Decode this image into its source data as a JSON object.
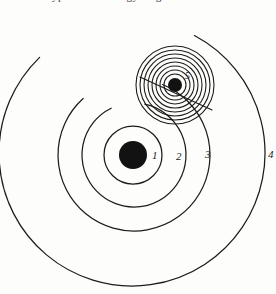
{
  "figure": {
    "background_color": "#fdfdfc",
    "ink_color": "#1c1c1c",
    "width": 276,
    "height": 294,
    "caption_remnant_text": "of the type of the energy of g"
  },
  "nucleus": {
    "label": "nucleus",
    "cx": 133,
    "cy": 155,
    "r": 14,
    "fill": "#121212"
  },
  "shells": [
    {
      "label": "1",
      "cx": 133,
      "cy": 155,
      "r": 29,
      "start_angle": 0,
      "sweep": 360,
      "label_x": 152,
      "label_y": 159
    },
    {
      "label": "2",
      "cx": 134,
      "cy": 155,
      "r": 52,
      "start_angle": 12,
      "sweep": 322,
      "label_x": 176,
      "label_y": 160
    },
    {
      "label": "3",
      "cx": 134,
      "cy": 155,
      "r": 76,
      "start_angle": 22,
      "sweep": 296,
      "label_x": 205,
      "label_y": 158
    },
    {
      "label": "4",
      "cx": 132,
      "cy": 153,
      "r": 133,
      "start_angle": 28,
      "sweep": 288,
      "label_x": 268,
      "label_y": 158
    }
  ],
  "electron": {
    "label": "5",
    "cx": 175,
    "cy": 85,
    "r": 7,
    "fill": "#121212",
    "label_x": 185,
    "label_y": 79,
    "wave_rings": [
      11,
      15,
      19,
      23,
      27,
      31,
      35,
      39
    ],
    "trajectory": {
      "label": "electron-trajectory",
      "x1": 140,
      "y1": 77,
      "x2": 212,
      "y2": 110
    }
  },
  "chart_data": {
    "type": "diagram",
    "subtitle": "Concentric electron shells about a nucleus, with an electron and its wave field",
    "elements": [
      {
        "name": "nucleus",
        "kind": "filled-circle",
        "center": [
          133,
          155
        ],
        "radius": 14
      },
      {
        "name": "shell-1",
        "kind": "circle",
        "center": [
          133,
          155
        ],
        "radius": 29,
        "label": "1"
      },
      {
        "name": "shell-2",
        "kind": "arc",
        "center": [
          134,
          155
        ],
        "radius": 52,
        "label": "2"
      },
      {
        "name": "shell-3",
        "kind": "arc",
        "center": [
          134,
          155
        ],
        "radius": 76,
        "label": "3"
      },
      {
        "name": "shell-4",
        "kind": "arc",
        "center": [
          132,
          153
        ],
        "radius": 133,
        "label": "4"
      },
      {
        "name": "electron",
        "kind": "filled-circle",
        "center": [
          175,
          85
        ],
        "radius": 7,
        "label": "5"
      },
      {
        "name": "electron-wave-rings",
        "kind": "concentric-circles",
        "center": [
          175,
          85
        ],
        "radii": [
          11,
          15,
          19,
          23,
          27,
          31,
          35,
          39
        ],
        "count": 8
      },
      {
        "name": "electron-trajectory",
        "kind": "line",
        "from": [
          140,
          77
        ],
        "to": [
          212,
          110
        ]
      }
    ],
    "labels": [
      "1",
      "2",
      "3",
      "4",
      "5"
    ],
    "grid": false,
    "legend": "none"
  }
}
